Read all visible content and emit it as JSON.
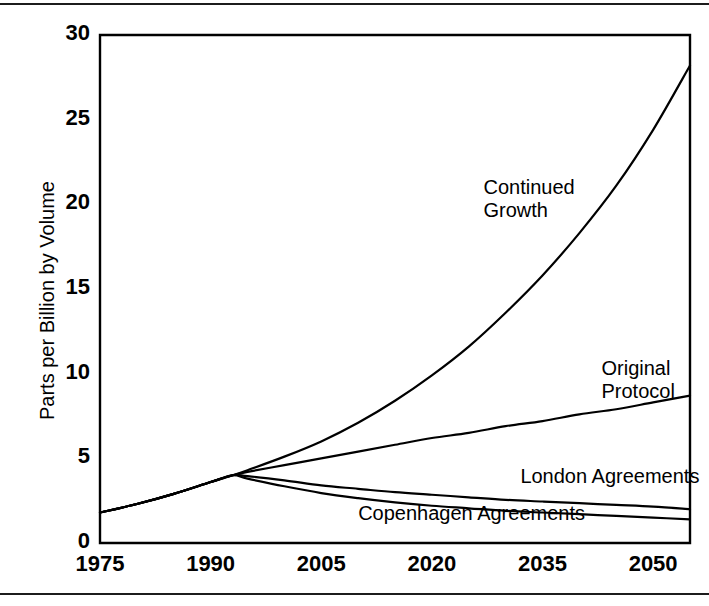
{
  "figure": {
    "background": "#ffffff",
    "ink_color": "#000000",
    "rule_color": "#1c1c1c"
  },
  "chart_data": {
    "type": "line",
    "title": "",
    "subtitle": "",
    "xlabel": "",
    "ylabel": "Parts per Billion by Volume",
    "xlim": [
      1975,
      2055
    ],
    "ylim": [
      0,
      30
    ],
    "xticks": [
      1975,
      1990,
      2005,
      2020,
      2035,
      2050
    ],
    "xtick_labels": [
      "1975",
      "1990",
      "2005",
      "2020",
      "2035",
      "2050"
    ],
    "yticks": [
      0,
      5,
      10,
      15,
      20,
      25,
      30
    ],
    "ytick_labels": [
      "0",
      "5",
      "10",
      "15",
      "20",
      "25",
      "30"
    ],
    "grid": false,
    "legend": "inline-annotations",
    "legend_position": "on-curve",
    "x": [
      1975,
      1980,
      1985,
      1990,
      1993,
      1995,
      2000,
      2005,
      2010,
      2015,
      2020,
      2025,
      2030,
      2035,
      2040,
      2045,
      2050,
      2055
    ],
    "series": [
      {
        "name": "Continued Growth",
        "color": "#000000",
        "values": [
          1.8,
          2.3,
          2.9,
          3.6,
          4.0,
          4.3,
          5.1,
          6.0,
          7.1,
          8.4,
          9.9,
          11.6,
          13.6,
          15.8,
          18.3,
          21.1,
          24.4,
          28.2
        ]
      },
      {
        "name": "Original Protocol",
        "color": "#000000",
        "values": [
          1.8,
          2.3,
          2.9,
          3.6,
          4.0,
          4.2,
          4.6,
          5.0,
          5.4,
          5.8,
          6.2,
          6.5,
          6.9,
          7.2,
          7.6,
          7.9,
          8.3,
          8.7
        ]
      },
      {
        "name": "London Agreements",
        "color": "#000000",
        "values": [
          1.8,
          2.3,
          2.9,
          3.6,
          4.0,
          3.95,
          3.7,
          3.4,
          3.2,
          3.0,
          2.85,
          2.7,
          2.55,
          2.45,
          2.35,
          2.25,
          2.15,
          2.0
        ]
      },
      {
        "name": "Copenhagen  Agreements",
        "color": "#000000",
        "values": [
          1.8,
          2.3,
          2.9,
          3.6,
          4.0,
          3.8,
          3.35,
          2.95,
          2.65,
          2.4,
          2.2,
          2.05,
          1.9,
          1.8,
          1.7,
          1.6,
          1.5,
          1.4
        ]
      }
    ],
    "annotations": [
      {
        "text": "Continued",
        "text2": "Growth",
        "x": 2027,
        "y": 21.7
      },
      {
        "text": "Original",
        "text2": "Protocol",
        "x": 2043,
        "y": 11.0
      },
      {
        "text": "London Agreements",
        "text2": "",
        "x": 2032,
        "y": 4.6
      },
      {
        "text": "Copenhagen  Agreements",
        "text2": "",
        "x": 2010,
        "y": 2.4
      }
    ]
  }
}
